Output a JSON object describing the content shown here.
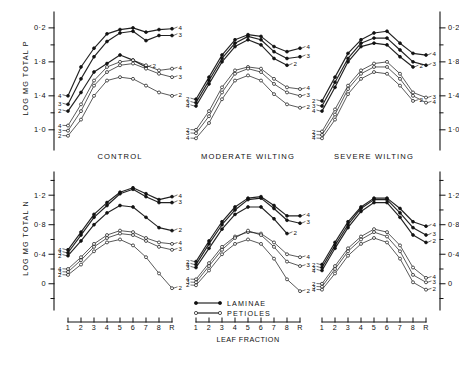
{
  "figure": {
    "background": "#ffffff",
    "ink": "#111111"
  },
  "axes": {
    "y_top_label": "LOG MG TOTAL P",
    "y_bottom_label": "LOG MG TOTAL N",
    "x_label": "LEAF  FRACTION",
    "top_ticks": [
      "0·2",
      "1·8",
      "1·4",
      "1·0"
    ],
    "bottom_ticks": [
      "1·2",
      "0·8",
      "0·4",
      "0"
    ],
    "x_ticks": [
      "1",
      "2",
      "3",
      "4",
      "5",
      "6",
      "7",
      "8",
      "R"
    ]
  },
  "panel_titles": [
    "CONTROL",
    "MODERATE WILTING",
    "SEVERE WILTING"
  ],
  "legend": [
    {
      "label": "LAMINAE",
      "marker": "filled-circle"
    },
    {
      "label": "PETIOLES",
      "marker": "open-circle"
    }
  ],
  "chart_data": {
    "type": "line",
    "title": "",
    "xlabel": "LEAF  FRACTION",
    "x": [
      "1",
      "2",
      "3",
      "4",
      "5",
      "6",
      "7",
      "8",
      "R"
    ],
    "grid": false,
    "legend_position": "bottom-center",
    "panels": [
      {
        "row": "top",
        "column": "CONTROL",
        "ylabel": "LOG MG TOTAL P",
        "ylim": [
          0.88,
          2.34
        ],
        "yticks": [
          2.2,
          1.8,
          1.4,
          1.0
        ],
        "ytick_labels": [
          "0·2",
          "1·8",
          "1·4",
          "1·0"
        ],
        "series": [
          {
            "name": "4",
            "group": "laminae",
            "marker": "filled-circle",
            "start_label": "4",
            "end_label": "4",
            "values": [
              1.4,
              1.74,
              1.96,
              2.13,
              2.18,
              2.2,
              2.15,
              2.18,
              2.19
            ]
          },
          {
            "name": "3",
            "group": "laminae",
            "marker": "filled-circle",
            "start_label": "3",
            "end_label": "3",
            "values": [
              1.3,
              1.6,
              1.86,
              2.04,
              2.14,
              2.16,
              2.05,
              2.11,
              2.11
            ]
          },
          {
            "name": "2",
            "group": "laminae",
            "marker": "filled-circle",
            "start_label": "2",
            "end_label": "2",
            "values": [
              1.22,
              1.44,
              1.68,
              1.78,
              1.88,
              1.82,
              1.74,
              null,
              null
            ]
          },
          {
            "name": "4",
            "group": "petioles",
            "marker": "open-circle",
            "start_label": "4",
            "end_label": "4",
            "values": [
              1.05,
              1.3,
              1.58,
              1.74,
              1.8,
              1.82,
              1.76,
              1.7,
              1.72
            ]
          },
          {
            "name": "3",
            "group": "petioles",
            "marker": "open-circle",
            "start_label": "3",
            "end_label": "3",
            "values": [
              0.99,
              1.22,
              1.52,
              1.68,
              1.76,
              1.78,
              1.72,
              1.66,
              1.62
            ]
          },
          {
            "name": "2",
            "group": "petioles",
            "marker": "open-circle",
            "start_label": "2",
            "end_label": "2",
            "values": [
              0.93,
              1.12,
              1.4,
              1.58,
              1.62,
              1.6,
              1.52,
              1.44,
              1.4
            ]
          }
        ]
      },
      {
        "row": "top",
        "column": "MODERATE WILTING",
        "ylabel": "",
        "ylim": [
          0.88,
          2.34
        ],
        "series": [
          {
            "name": "4",
            "group": "laminae",
            "marker": "filled-circle",
            "start_label": "2",
            "end_label": "4",
            "values": [
              1.36,
              1.62,
              1.88,
              2.06,
              2.12,
              2.1,
              1.98,
              1.92,
              1.96
            ]
          },
          {
            "name": "3",
            "group": "laminae",
            "marker": "filled-circle",
            "start_label": "3",
            "end_label": "3",
            "values": [
              1.32,
              1.58,
              1.84,
              2.02,
              2.1,
              2.06,
              1.92,
              1.84,
              1.86
            ]
          },
          {
            "name": "2",
            "group": "laminae",
            "marker": "filled-circle",
            "start_label": "4",
            "end_label": "2",
            "values": [
              1.28,
              1.54,
              1.8,
              1.98,
              2.06,
              2.0,
              1.84,
              1.76,
              null
            ]
          },
          {
            "name": "4",
            "group": "petioles",
            "marker": "open-circle",
            "start_label": "2",
            "end_label": "4",
            "values": [
              1.0,
              1.22,
              1.5,
              1.7,
              1.74,
              1.72,
              1.6,
              1.5,
              1.48
            ]
          },
          {
            "name": "3",
            "group": "petioles",
            "marker": "open-circle",
            "start_label": "3",
            "end_label": "3",
            "values": [
              0.96,
              1.16,
              1.44,
              1.66,
              1.72,
              1.68,
              1.54,
              1.44,
              1.4
            ]
          },
          {
            "name": "2",
            "group": "petioles",
            "marker": "open-circle",
            "start_label": "4",
            "end_label": "2",
            "values": [
              0.9,
              1.08,
              1.36,
              1.58,
              1.64,
              1.58,
              1.42,
              1.3,
              1.26
            ]
          }
        ]
      },
      {
        "row": "top",
        "column": "SEVERE WILTING",
        "ylabel": "",
        "ylim": [
          0.88,
          2.34
        ],
        "yticks_right": [
          2.2,
          1.8,
          1.4,
          1.0
        ],
        "ytick_labels_right": [
          "0·2",
          "1·8",
          "1·4",
          "1·0"
        ],
        "series": [
          {
            "name": "4",
            "group": "laminae",
            "marker": "filled-circle",
            "start_label": "2",
            "end_label": "4",
            "values": [
              1.34,
              1.62,
              1.9,
              2.06,
              2.14,
              2.16,
              2.02,
              1.9,
              1.88
            ]
          },
          {
            "name": "3",
            "group": "laminae",
            "marker": "filled-circle",
            "start_label": "3",
            "end_label": "3",
            "values": [
              1.28,
              1.56,
              1.84,
              2.02,
              2.08,
              2.08,
              1.94,
              1.8,
              1.76
            ]
          },
          {
            "name": "2",
            "group": "laminae",
            "marker": "filled-circle",
            "start_label": "4",
            "end_label": "2",
            "values": [
              1.22,
              1.5,
              1.8,
              1.98,
              2.02,
              2.0,
              1.86,
              1.74,
              null
            ]
          },
          {
            "name": "3",
            "group": "petioles",
            "marker": "open-circle",
            "start_label": "2",
            "end_label": "3",
            "values": [
              0.98,
              1.24,
              1.52,
              1.7,
              1.78,
              1.8,
              1.66,
              1.44,
              1.38
            ]
          },
          {
            "name": "4",
            "group": "petioles",
            "marker": "open-circle",
            "start_label": "3",
            "end_label": "4",
            "values": [
              0.94,
              1.18,
              1.48,
              1.66,
              1.74,
              1.74,
              1.6,
              1.4,
              1.32
            ]
          },
          {
            "name": "2",
            "group": "petioles",
            "marker": "open-circle",
            "start_label": "4",
            "end_label": "2",
            "values": [
              0.9,
              1.12,
              1.42,
              1.6,
              1.68,
              1.66,
              1.52,
              1.34,
              null
            ]
          }
        ]
      },
      {
        "row": "bottom",
        "column": "CONTROL",
        "ylabel": "LOG MG TOTAL N",
        "ylim": [
          -0.22,
          1.46
        ],
        "yticks": [
          1.2,
          0.8,
          0.4,
          0.0
        ],
        "ytick_labels": [
          "1·2",
          "0·8",
          "0·4",
          "0"
        ],
        "series": [
          {
            "name": "4",
            "group": "laminae",
            "marker": "filled-circle",
            "start_label": "4",
            "end_label": "4",
            "values": [
              0.46,
              0.7,
              0.94,
              1.1,
              1.24,
              1.3,
              1.22,
              1.14,
              1.18
            ]
          },
          {
            "name": "3",
            "group": "laminae",
            "marker": "filled-circle",
            "start_label": "3",
            "end_label": "3",
            "values": [
              0.42,
              0.66,
              0.9,
              1.06,
              1.22,
              1.28,
              1.18,
              1.1,
              1.1
            ]
          },
          {
            "name": "2",
            "group": "laminae",
            "marker": "filled-circle",
            "start_label": "2",
            "end_label": "2",
            "values": [
              0.38,
              0.58,
              0.8,
              0.96,
              1.06,
              1.04,
              0.9,
              0.76,
              0.72
            ]
          },
          {
            "name": "4",
            "group": "petioles",
            "marker": "open-circle",
            "start_label": "4",
            "end_label": "4",
            "values": [
              0.2,
              0.36,
              0.54,
              0.66,
              0.72,
              0.7,
              0.62,
              0.56,
              0.54
            ]
          },
          {
            "name": "3",
            "group": "petioles",
            "marker": "open-circle",
            "start_label": "3",
            "end_label": "3",
            "values": [
              0.16,
              0.32,
              0.5,
              0.62,
              0.68,
              0.66,
              0.58,
              0.5,
              0.46
            ]
          },
          {
            "name": "2",
            "group": "petioles",
            "marker": "open-circle",
            "start_label": "2",
            "end_label": "2",
            "values": [
              0.12,
              0.26,
              0.44,
              0.56,
              0.6,
              0.52,
              0.36,
              0.14,
              -0.06
            ]
          }
        ]
      },
      {
        "row": "bottom",
        "column": "MODERATE WILTING",
        "ylabel": "",
        "ylim": [
          -0.22,
          1.46
        ],
        "series": [
          {
            "name": "4",
            "group": "laminae",
            "marker": "filled-circle",
            "start_label": "2",
            "end_label": "4",
            "values": [
              0.3,
              0.58,
              0.84,
              1.04,
              1.16,
              1.18,
              1.06,
              0.92,
              0.92
            ]
          },
          {
            "name": "3",
            "group": "laminae",
            "marker": "filled-circle",
            "start_label": "4",
            "end_label": "3",
            "values": [
              0.26,
              0.54,
              0.8,
              1.0,
              1.14,
              1.16,
              1.02,
              0.86,
              0.82
            ]
          },
          {
            "name": "2",
            "group": "laminae",
            "marker": "filled-circle",
            "start_label": "3",
            "end_label": "2",
            "values": [
              0.22,
              0.48,
              0.74,
              0.94,
              1.04,
              1.04,
              0.88,
              0.68,
              null
            ]
          },
          {
            "name": "4",
            "group": "petioles",
            "marker": "open-circle",
            "start_label": "4",
            "end_label": "4",
            "values": [
              0.06,
              0.28,
              0.5,
              0.64,
              0.7,
              0.68,
              0.56,
              0.4,
              0.36
            ]
          },
          {
            "name": "3",
            "group": "petioles",
            "marker": "open-circle",
            "start_label": "3",
            "end_label": "3",
            "values": [
              0.02,
              0.24,
              0.46,
              0.62,
              0.72,
              0.66,
              0.5,
              0.3,
              0.24
            ]
          },
          {
            "name": "2",
            "group": "petioles",
            "marker": "open-circle",
            "start_label": "2",
            "end_label": "2",
            "values": [
              -0.02,
              0.18,
              0.4,
              0.54,
              0.6,
              0.54,
              0.34,
              0.06,
              -0.1
            ]
          }
        ]
      },
      {
        "row": "bottom",
        "column": "SEVERE WILTING",
        "ylabel": "",
        "ylim": [
          -0.22,
          1.46
        ],
        "yticks_right": [
          1.2,
          0.8,
          0.4,
          0.0
        ],
        "ytick_labels_right": [
          "1·2",
          "0·8",
          "0·4",
          "0"
        ],
        "series": [
          {
            "name": "4",
            "group": "laminae",
            "marker": "filled-circle",
            "start_label": "2",
            "end_label": "4",
            "values": [
              0.26,
              0.56,
              0.84,
              1.04,
              1.16,
              1.16,
              1.02,
              0.84,
              0.78
            ]
          },
          {
            "name": "3",
            "group": "laminae",
            "marker": "filled-circle",
            "start_label": "3",
            "end_label": "3",
            "values": [
              0.22,
              0.52,
              0.8,
              1.02,
              1.14,
              1.14,
              0.96,
              0.76,
              0.66
            ]
          },
          {
            "name": "2",
            "group": "laminae",
            "marker": "filled-circle",
            "start_label": "4",
            "end_label": "2",
            "values": [
              0.18,
              0.48,
              0.76,
              0.98,
              1.1,
              1.1,
              0.9,
              0.66,
              0.56
            ]
          },
          {
            "name": "4",
            "group": "petioles",
            "marker": "open-circle",
            "start_label": "2",
            "end_label": "4",
            "values": [
              0.0,
              0.24,
              0.48,
              0.64,
              0.74,
              0.7,
              0.52,
              0.22,
              0.08
            ]
          },
          {
            "name": "3",
            "group": "petioles",
            "marker": "open-circle",
            "start_label": "3",
            "end_label": "3",
            "values": [
              -0.04,
              0.2,
              0.44,
              0.6,
              0.7,
              0.64,
              0.44,
              0.12,
              0.02
            ]
          },
          {
            "name": "2",
            "group": "petioles",
            "marker": "open-circle",
            "start_label": "4",
            "end_label": "2",
            "values": [
              -0.08,
              0.14,
              0.38,
              0.54,
              0.62,
              0.56,
              0.34,
              0.02,
              -0.08
            ]
          }
        ]
      }
    ]
  }
}
